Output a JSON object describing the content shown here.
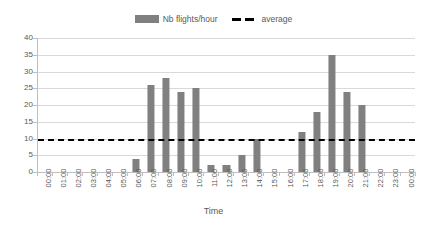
{
  "legend": {
    "items": [
      {
        "label": "Nb flights/hour",
        "marker": "bar-swatch-icon",
        "color": "#808080"
      },
      {
        "label": "average",
        "marker": "dashed-line-icon",
        "color": "#000000"
      }
    ]
  },
  "axes": {
    "x_title": "Time",
    "y_title": "",
    "y_ticks": [
      "0",
      "5",
      "10",
      "15",
      "20",
      "25",
      "30",
      "35",
      "40"
    ]
  },
  "chart_data": {
    "type": "bar",
    "title": "",
    "xlabel": "Time",
    "ylabel": "",
    "ylim": [
      0,
      40
    ],
    "ytick_step": 5,
    "grid": true,
    "legend_position": "top-center",
    "bar_color": "#808080",
    "categories": [
      "00:00",
      "01:00",
      "02:00",
      "03:00",
      "04:00",
      "05:00",
      "06:00",
      "07:00",
      "08:00",
      "09:00",
      "10:00",
      "11:00",
      "12:00",
      "13:00",
      "14:00",
      "15:00",
      "16:00",
      "17:00",
      "18:00",
      "19:00",
      "20:00",
      "21:00",
      "22:00",
      "23:00",
      "00:00"
    ],
    "series": [
      {
        "name": "Nb flights/hour",
        "type": "bar",
        "values": [
          0,
          0,
          0,
          0,
          0,
          0,
          4,
          26,
          28,
          24,
          25,
          2,
          2,
          5,
          10,
          0,
          0,
          12,
          18,
          35,
          24,
          20,
          0,
          0,
          0
        ]
      },
      {
        "name": "average",
        "type": "line",
        "style": "dashed",
        "color": "#000000",
        "value": 10
      }
    ]
  }
}
